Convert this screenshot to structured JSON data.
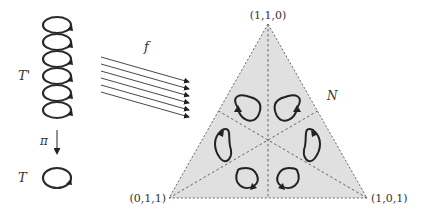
{
  "diagram": {
    "covering_space": {
      "label": "T'"
    },
    "base_space": {
      "label": "T"
    },
    "projection": {
      "label": "π"
    },
    "map": {
      "label": "f"
    },
    "simplex": {
      "label": "N",
      "vertices": {
        "top": "(1,1,0)",
        "bottom_left": "(0,1,1)",
        "bottom_right": "(1,0,1)"
      },
      "fill_color": "#e0e0e0",
      "loop_count": 6
    },
    "helix_turns": 6,
    "arrow_count": 6
  }
}
